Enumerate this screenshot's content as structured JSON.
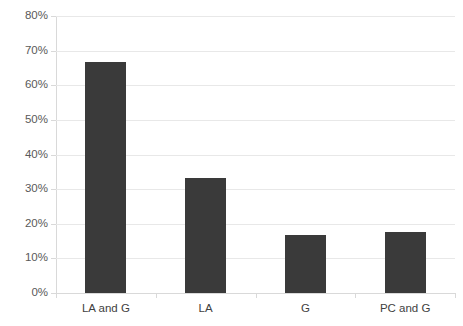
{
  "chart_data": {
    "type": "bar",
    "title": "",
    "subtitle": "",
    "xlabel": "",
    "ylabel": "",
    "categories": [
      "LA and G",
      "LA",
      "G",
      "PC and G"
    ],
    "values": [
      66.7,
      33.3,
      16.7,
      17.5
    ],
    "value_unit": "%",
    "ylim": [
      0,
      80
    ],
    "ytick_step": 10,
    "ytick_labels": [
      "0%",
      "10%",
      "20%",
      "30%",
      "40%",
      "50%",
      "60%",
      "70%",
      "80%"
    ],
    "ytick_values": [
      0,
      10,
      20,
      30,
      40,
      50,
      60,
      70,
      80
    ],
    "grid": true,
    "grid_axis": "y",
    "legend": false,
    "legend_position": "none",
    "series": [
      {
        "name": "",
        "values": [
          66.7,
          33.3,
          16.7,
          17.5
        ]
      }
    ],
    "colors": {
      "bar": "#3a3a3a",
      "gridline": "#e8e8e8",
      "axis": "#d9d9d9",
      "tick_label": "#595959",
      "category_label": "#3f3f3f",
      "background": "#ffffff"
    }
  }
}
